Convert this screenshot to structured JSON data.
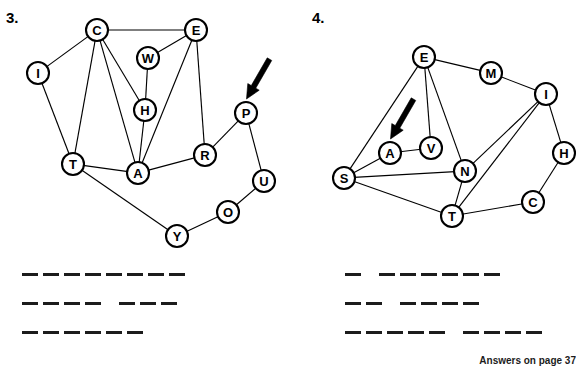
{
  "page": {
    "footer_note": "Answers on page 37"
  },
  "problems": [
    {
      "number": "3.",
      "arrow": {
        "target_node": "P",
        "direction": "down-left"
      },
      "graph": {
        "nodes": [
          {
            "id": "C",
            "label": "C",
            "x": 97,
            "y": 30
          },
          {
            "id": "E",
            "label": "E",
            "x": 196,
            "y": 30
          },
          {
            "id": "I",
            "label": "I",
            "x": 38,
            "y": 73
          },
          {
            "id": "W",
            "label": "W",
            "x": 148,
            "y": 58
          },
          {
            "id": "H",
            "label": "H",
            "x": 145,
            "y": 110
          },
          {
            "id": "P",
            "label": "P",
            "x": 246,
            "y": 113
          },
          {
            "id": "R",
            "label": "R",
            "x": 205,
            "y": 155
          },
          {
            "id": "T",
            "label": "T",
            "x": 73,
            "y": 164
          },
          {
            "id": "A",
            "label": "A",
            "x": 138,
            "y": 173
          },
          {
            "id": "U",
            "label": "U",
            "x": 264,
            "y": 181
          },
          {
            "id": "O",
            "label": "O",
            "x": 228,
            "y": 212
          },
          {
            "id": "Y",
            "label": "Y",
            "x": 177,
            "y": 236
          }
        ],
        "edges": [
          [
            "C",
            "E"
          ],
          [
            "C",
            "I"
          ],
          [
            "C",
            "T"
          ],
          [
            "C",
            "H"
          ],
          [
            "C",
            "A"
          ],
          [
            "E",
            "W"
          ],
          [
            "E",
            "A"
          ],
          [
            "E",
            "R"
          ],
          [
            "W",
            "H"
          ],
          [
            "H",
            "A"
          ],
          [
            "I",
            "T"
          ],
          [
            "T",
            "A"
          ],
          [
            "T",
            "Y"
          ],
          [
            "A",
            "R"
          ],
          [
            "R",
            "P"
          ],
          [
            "P",
            "U"
          ],
          [
            "U",
            "O"
          ],
          [
            "O",
            "Y"
          ]
        ]
      },
      "answer_rows": [
        {
          "groups": [
            8
          ]
        },
        {
          "groups": [
            4,
            3
          ]
        },
        {
          "groups": [
            6
          ]
        }
      ]
    },
    {
      "number": "4.",
      "arrow": {
        "target_node": "A",
        "direction": "down-left"
      },
      "graph": {
        "nodes": [
          {
            "id": "E",
            "label": "E",
            "x": 133,
            "y": 57
          },
          {
            "id": "M",
            "label": "M",
            "x": 200,
            "y": 73
          },
          {
            "id": "I",
            "label": "I",
            "x": 255,
            "y": 94
          },
          {
            "id": "A",
            "label": "A",
            "x": 99,
            "y": 153
          },
          {
            "id": "V",
            "label": "V",
            "x": 140,
            "y": 148
          },
          {
            "id": "N",
            "label": "N",
            "x": 174,
            "y": 171
          },
          {
            "id": "H",
            "label": "H",
            "x": 273,
            "y": 153
          },
          {
            "id": "S",
            "label": "S",
            "x": 53,
            "y": 178
          },
          {
            "id": "T",
            "label": "T",
            "x": 161,
            "y": 216
          },
          {
            "id": "C",
            "label": "C",
            "x": 242,
            "y": 202
          }
        ],
        "edges": [
          [
            "E",
            "M"
          ],
          [
            "E",
            "S"
          ],
          [
            "E",
            "V"
          ],
          [
            "E",
            "N"
          ],
          [
            "M",
            "I"
          ],
          [
            "I",
            "N"
          ],
          [
            "I",
            "T"
          ],
          [
            "I",
            "H"
          ],
          [
            "A",
            "S"
          ],
          [
            "A",
            "V"
          ],
          [
            "S",
            "N"
          ],
          [
            "S",
            "T"
          ],
          [
            "N",
            "T"
          ],
          [
            "T",
            "C"
          ],
          [
            "C",
            "H"
          ]
        ]
      },
      "answer_rows": [
        {
          "groups": [
            1,
            6
          ]
        },
        {
          "groups": [
            2,
            4
          ]
        },
        {
          "groups": [
            5,
            4
          ]
        }
      ]
    }
  ]
}
